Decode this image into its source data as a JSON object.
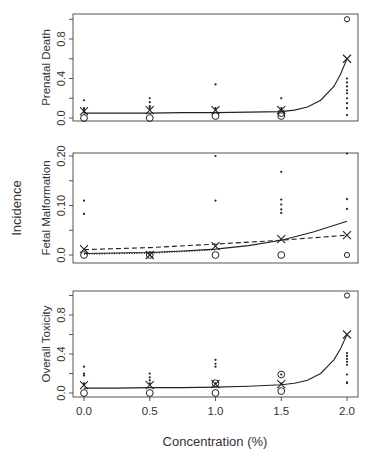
{
  "figure": {
    "shared_ylabel": "Incidence",
    "xlabel": "Concentration (%)",
    "x_ticks": [
      "0.0",
      "0.5",
      "1.0",
      "1.5",
      "2.0"
    ]
  },
  "chart_data": [
    {
      "type": "scatter",
      "title": "",
      "xlabel": "Concentration (%)",
      "ylabel": "Prenatal Death",
      "x": [
        0.0,
        0.5,
        1.0,
        1.5,
        2.0
      ],
      "xlim": [
        -0.08,
        2.08
      ],
      "ylim": [
        -0.03,
        1.05
      ],
      "y_ticks": [
        "0.0",
        "0.4",
        "0.8"
      ],
      "y_tick_values": [
        0.0,
        0.4,
        0.8
      ],
      "series": [
        {
          "name": "litter proportions (dots)",
          "marker": "dot",
          "points": [
            [
              0,
              0.18
            ],
            [
              0,
              0.1
            ],
            [
              0,
              0.08
            ],
            [
              0,
              0.06
            ],
            [
              0.5,
              0.2
            ],
            [
              0.5,
              0.16
            ],
            [
              0.5,
              0.12
            ],
            [
              0.5,
              0.1
            ],
            [
              1.0,
              0.34
            ],
            [
              1.0,
              0.1
            ],
            [
              1.0,
              0.08
            ],
            [
              1.5,
              0.2
            ],
            [
              1.5,
              0.1
            ],
            [
              2.0,
              0.4
            ],
            [
              2.0,
              0.36
            ],
            [
              2.0,
              0.32
            ],
            [
              2.0,
              0.28
            ],
            [
              2.0,
              0.25
            ],
            [
              2.0,
              0.2
            ],
            [
              2.0,
              0.15
            ],
            [
              2.0,
              0.1
            ],
            [
              2.0,
              0.03
            ]
          ]
        },
        {
          "name": "observed mean (X)",
          "marker": "x",
          "points": [
            [
              0,
              0.07
            ],
            [
              0.5,
              0.08
            ],
            [
              1.0,
              0.08
            ],
            [
              1.5,
              0.08
            ],
            [
              2.0,
              0.6
            ]
          ]
        },
        {
          "name": "proportion of all-affected litters (O)",
          "marker": "circle",
          "points": [
            [
              0,
              0.0
            ],
            [
              0.5,
              0.0
            ],
            [
              1.0,
              0.02
            ],
            [
              1.5,
              0.02
            ],
            [
              1.5,
              0.05
            ],
            [
              2.0,
              1.0
            ]
          ]
        },
        {
          "name": "fitted dose-response",
          "style": "solid",
          "x": [
            0,
            0.25,
            0.5,
            0.75,
            1.0,
            1.25,
            1.5,
            1.6,
            1.7,
            1.8,
            1.9,
            1.95,
            2.0
          ],
          "y": [
            0.05,
            0.05,
            0.05,
            0.055,
            0.055,
            0.06,
            0.065,
            0.08,
            0.11,
            0.18,
            0.32,
            0.44,
            0.6
          ]
        }
      ]
    },
    {
      "type": "scatter",
      "title": "",
      "xlabel": "Concentration (%)",
      "ylabel": "Fetal Malformation",
      "x": [
        0.0,
        0.5,
        1.0,
        1.5,
        2.0
      ],
      "xlim": [
        -0.08,
        2.08
      ],
      "ylim": [
        -0.015,
        0.205
      ],
      "y_ticks": [
        "0.0",
        "0.10",
        "0.20"
      ],
      "y_tick_values": [
        0.0,
        0.1,
        0.2
      ],
      "minor_tick_values": [
        0.05,
        0.15
      ],
      "series": [
        {
          "name": "litter proportions (dots)",
          "marker": "dot",
          "points": [
            [
              0,
              0.11
            ],
            [
              0,
              0.083
            ],
            [
              1.0,
              0.2
            ],
            [
              1.0,
              0.11
            ],
            [
              1.5,
              0.168
            ],
            [
              1.5,
              0.112
            ],
            [
              1.5,
              0.102
            ],
            [
              1.5,
              0.092
            ],
            [
              1.5,
              0.085
            ],
            [
              2.0,
              0.205
            ],
            [
              2.0,
              0.113
            ],
            [
              2.0,
              0.093
            ]
          ]
        },
        {
          "name": "observed mean (X)",
          "marker": "x",
          "points": [
            [
              0,
              0.012
            ],
            [
              0.5,
              0.0
            ],
            [
              1.0,
              0.018
            ],
            [
              1.5,
              0.032
            ],
            [
              2.0,
              0.04
            ]
          ]
        },
        {
          "name": "proportion of all-affected litters (O)",
          "marker": "circle",
          "points": [
            [
              0,
              0.0
            ],
            [
              0.5,
              0.0
            ],
            [
              1.0,
              0.0
            ],
            [
              1.5,
              0.0
            ],
            [
              2.0,
              0.0
            ]
          ]
        },
        {
          "name": "fitted model (solid)",
          "style": "solid",
          "x": [
            0,
            0.25,
            0.5,
            0.75,
            1.0,
            1.25,
            1.5,
            1.75,
            2.0
          ],
          "y": [
            0.003,
            0.004,
            0.005,
            0.008,
            0.012,
            0.019,
            0.03,
            0.047,
            0.068
          ]
        },
        {
          "name": "fitted model (dashed)",
          "style": "dashed",
          "x": [
            0,
            0.5,
            1.0,
            1.5,
            2.0
          ],
          "y": [
            0.011,
            0.015,
            0.022,
            0.03,
            0.04
          ]
        },
        {
          "name": "fitted model (dotted)",
          "style": "dotted",
          "x": [
            0,
            0.25,
            0.5,
            0.75,
            1.0
          ],
          "y": [
            0.002,
            0.003,
            0.004,
            0.007,
            0.011
          ]
        }
      ]
    },
    {
      "type": "scatter",
      "title": "",
      "xlabel": "Concentration (%)",
      "ylabel": "Overall Toxicity",
      "x": [
        0.0,
        0.5,
        1.0,
        1.5,
        2.0
      ],
      "xlim": [
        -0.08,
        2.08
      ],
      "ylim": [
        -0.04,
        1.05
      ],
      "y_ticks": [
        "0.0",
        "0.4",
        "0.8"
      ],
      "y_tick_values": [
        0.0,
        0.4,
        0.8
      ],
      "series": [
        {
          "name": "litter proportions (dots)",
          "marker": "dot",
          "points": [
            [
              0,
              0.27
            ],
            [
              0,
              0.2
            ],
            [
              0,
              0.18
            ],
            [
              0,
              0.1
            ],
            [
              0,
              0.08
            ],
            [
              0.5,
              0.2
            ],
            [
              0.5,
              0.16
            ],
            [
              0.5,
              0.13
            ],
            [
              0.5,
              0.1
            ],
            [
              1.0,
              0.34
            ],
            [
              1.0,
              0.3
            ],
            [
              1.0,
              0.27
            ],
            [
              1.0,
              0.1
            ],
            [
              1.5,
              0.19
            ],
            [
              1.5,
              0.1
            ],
            [
              2.0,
              0.41
            ],
            [
              2.0,
              0.38
            ],
            [
              2.0,
              0.35
            ],
            [
              2.0,
              0.32
            ],
            [
              2.0,
              0.29
            ],
            [
              2.0,
              0.19
            ],
            [
              2.0,
              0.11
            ],
            [
              2.0,
              0.1
            ]
          ]
        },
        {
          "name": "observed mean (X)",
          "marker": "x",
          "points": [
            [
              0,
              0.08
            ],
            [
              0.5,
              0.08
            ],
            [
              1.0,
              0.09
            ],
            [
              1.5,
              0.09
            ],
            [
              2.0,
              0.6
            ]
          ]
        },
        {
          "name": "proportion of all-affected litters (O)",
          "marker": "circle",
          "points": [
            [
              0,
              0.0
            ],
            [
              0.5,
              0.0
            ],
            [
              1.0,
              0.0
            ],
            [
              1.0,
              0.1
            ],
            [
              1.5,
              0.02
            ],
            [
              1.5,
              0.19
            ],
            [
              2.0,
              1.0
            ]
          ]
        },
        {
          "name": "fitted dose-response",
          "style": "solid",
          "x": [
            0,
            0.25,
            0.5,
            0.75,
            1.0,
            1.25,
            1.5,
            1.6,
            1.7,
            1.8,
            1.9,
            1.95,
            2.0
          ],
          "y": [
            0.05,
            0.05,
            0.055,
            0.055,
            0.06,
            0.07,
            0.085,
            0.1,
            0.13,
            0.2,
            0.34,
            0.45,
            0.6
          ]
        }
      ]
    }
  ],
  "layout": {
    "panels": [
      {
        "left": 73,
        "right": 358,
        "top": 14,
        "bottom": 121,
        "y0px": 118,
        "yscale": 98.75
      },
      {
        "left": 73,
        "right": 358,
        "top": 153,
        "bottom": 263,
        "y0px": 255,
        "yscale": 495
      },
      {
        "left": 73,
        "right": 358,
        "top": 291,
        "bottom": 397,
        "y0px": 393,
        "yscale": 97.5
      }
    ],
    "x0px": 84,
    "xscale": 131.5
  }
}
